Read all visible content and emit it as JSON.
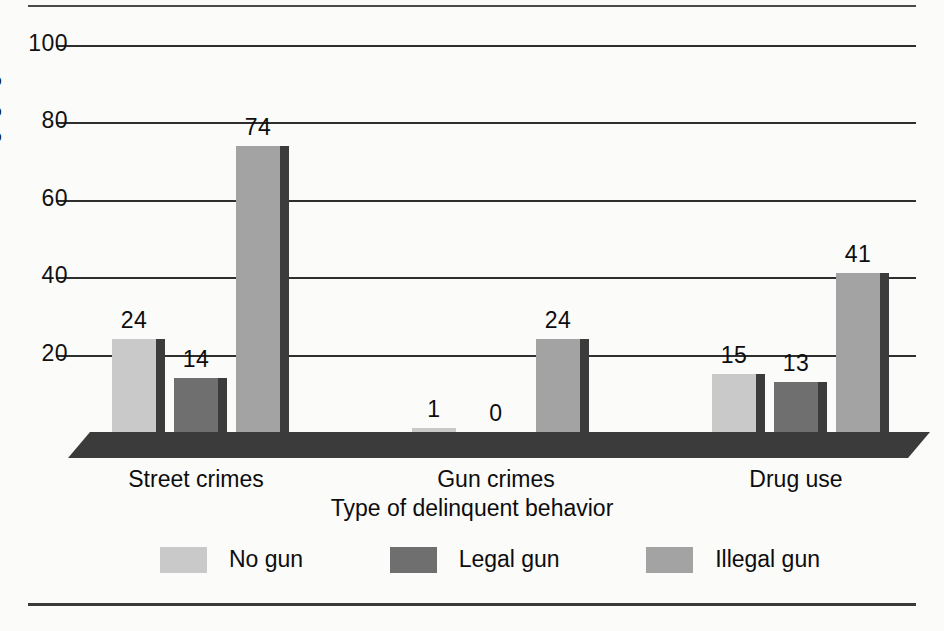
{
  "chart_data": {
    "type": "bar",
    "title": "",
    "xlabel": "Type of delinquent behavior",
    "ylabel": "Percent engaging in behavior",
    "categories": [
      "Street crimes",
      "Gun crimes",
      "Drug use"
    ],
    "series": [
      {
        "name": "No gun",
        "values": [
          24,
          1,
          15
        ],
        "color": "#c9c9c9"
      },
      {
        "name": "Legal gun",
        "values": [
          14,
          0,
          13
        ],
        "color": "#6f6f6f"
      },
      {
        "name": "Illegal gun",
        "values": [
          74,
          24,
          41
        ],
        "color": "#a3a3a3"
      }
    ],
    "ylim": [
      0,
      100
    ],
    "yticks": [
      "100",
      "80",
      "60",
      "40",
      "20"
    ],
    "ytick_values": [
      100,
      80,
      60,
      40,
      20
    ],
    "grid": true,
    "legend_position": "bottom",
    "bar_labels": [
      "24",
      "14",
      "74",
      "1",
      "0",
      "24",
      "15",
      "13",
      "41"
    ]
  },
  "axes": {
    "y_title": "Percent engaging in behavior",
    "x_title": "Type of delinquent behavior",
    "ticks": [
      {
        "label": "100"
      },
      {
        "label": "80"
      },
      {
        "label": "60"
      },
      {
        "label": "40"
      },
      {
        "label": "20"
      }
    ]
  },
  "groups": [
    {
      "label": "Street crimes",
      "bars": [
        {
          "series": "No gun",
          "label": "24",
          "value": 24
        },
        {
          "series": "Legal gun",
          "label": "14",
          "value": 14
        },
        {
          "series": "Illegal gun",
          "label": "74",
          "value": 74
        }
      ]
    },
    {
      "label": "Gun crimes",
      "bars": [
        {
          "series": "No gun",
          "label": "1",
          "value": 1
        },
        {
          "series": "Legal gun",
          "label": "0",
          "value": 0
        },
        {
          "series": "Illegal gun",
          "label": "24",
          "value": 24
        }
      ]
    },
    {
      "label": "Drug use",
      "bars": [
        {
          "series": "No gun",
          "label": "15",
          "value": 15
        },
        {
          "series": "Legal gun",
          "label": "13",
          "value": 13
        },
        {
          "series": "Illegal gun",
          "label": "41",
          "value": 41
        }
      ]
    }
  ],
  "legend": {
    "items": [
      {
        "label": "No gun",
        "color": "#c9c9c9"
      },
      {
        "label": "Legal gun",
        "color": "#6f6f6f"
      },
      {
        "label": "Illegal gun",
        "color": "#a3a3a3"
      }
    ]
  },
  "colors": {
    "no_gun": "#c9c9c9",
    "legal_gun": "#6f6f6f",
    "illegal_gun": "#a3a3a3",
    "platform": "#3b3b3b",
    "gridline": "#2f2f2f",
    "text": "#0d0d0d",
    "background": "#fbfbfa"
  }
}
